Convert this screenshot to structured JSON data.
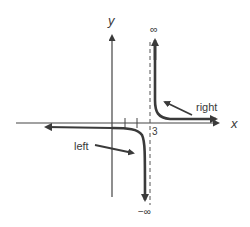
{
  "diagram": {
    "axes": {
      "x_label": "x",
      "y_label": "y"
    },
    "asymptote": {
      "x_value": 3,
      "label": "3",
      "top_label": "∞",
      "bottom_label": "−∞"
    },
    "ticks": [
      1,
      2
    ],
    "annotations": {
      "left_label": "left",
      "right_label": "right"
    },
    "colors": {
      "ink": "#3a3a3a",
      "axis": "#444444",
      "background": "#ffffff"
    }
  }
}
